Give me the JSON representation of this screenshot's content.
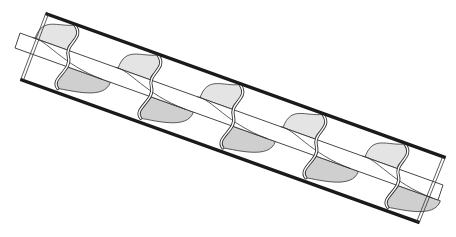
{
  "diagram": {
    "subject": "screw-conveyor",
    "flight_count": 5,
    "colors": {
      "background": "#ffffff",
      "tube_stroke": "#1a1a1a",
      "line": "#333333",
      "flight_fill_light": "#e4e4e4",
      "flight_fill_dark": "#cfcfcf"
    },
    "tube": {
      "top_edge": [
        [
          47,
          14
        ],
        [
          444,
          157
        ]
      ],
      "bottom_edge": [
        [
          22,
          80
        ],
        [
          418,
          222
        ]
      ]
    },
    "shaft": {
      "left": [
        [
          20,
          33
        ],
        [
          15,
          48
        ]
      ],
      "right": [
        [
          443,
          185
        ],
        [
          438,
          200
        ]
      ]
    },
    "flights_x": [
      75,
      158,
      240,
      323,
      405
    ]
  }
}
